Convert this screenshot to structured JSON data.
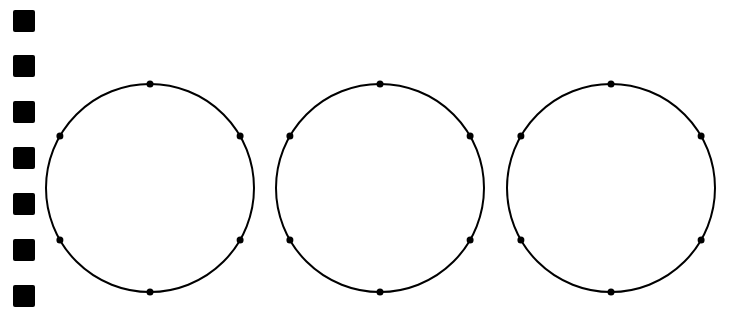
{
  "canvas": {
    "width": 743,
    "height": 319,
    "background": "#ffffff"
  },
  "colors": {
    "ink": "#000000"
  },
  "markers": {
    "count": 7,
    "size": 22,
    "x": 13,
    "items": [
      {
        "y": 10
      },
      {
        "y": 55
      },
      {
        "y": 101
      },
      {
        "y": 147
      },
      {
        "y": 193
      },
      {
        "y": 239
      },
      {
        "y": 285
      }
    ]
  },
  "circles": {
    "radius": 104,
    "stroke_width": 2,
    "dot_radius": 3.5,
    "dot_angles_deg": [
      90,
      30,
      -30,
      -90,
      -150,
      150
    ],
    "items": [
      {
        "cx": 150,
        "cy": 188
      },
      {
        "cx": 380,
        "cy": 188
      },
      {
        "cx": 611,
        "cy": 188
      }
    ]
  }
}
